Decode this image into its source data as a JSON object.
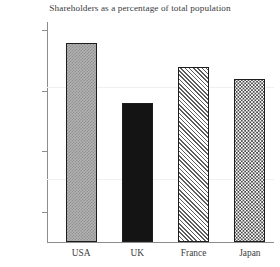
{
  "chart_data": {
    "type": "bar",
    "title": "Shareholders as a percentage of total population",
    "xlabel": "",
    "ylabel": "",
    "categories": [
      "USA",
      "UK",
      "France",
      "Japan"
    ],
    "values": [
      24,
      19,
      22,
      21
    ],
    "value_unit": "%",
    "ylim": [
      7.5,
      25.7
    ],
    "yticks": [
      10,
      15,
      20,
      25
    ],
    "ytick_labels": [
      "10%",
      "15%",
      "20%",
      "25%"
    ],
    "grid": false,
    "legend": null,
    "bar_styles": [
      {
        "category": "USA",
        "fill": "checkered-gray",
        "edge": "#1d1d1d"
      },
      {
        "category": "UK",
        "fill": "solid-black",
        "edge": "#1d1d1d"
      },
      {
        "category": "France",
        "fill": "diagonal-hatch",
        "edge": "#1d1d1d"
      },
      {
        "category": "Japan",
        "fill": "dotted-light",
        "edge": "#1d1d1d"
      }
    ],
    "colors": {
      "axis": "#8d8d8d",
      "text": "#3c3c3c",
      "background": "#ffffff",
      "bar_edge": "#1d1d1d"
    }
  }
}
